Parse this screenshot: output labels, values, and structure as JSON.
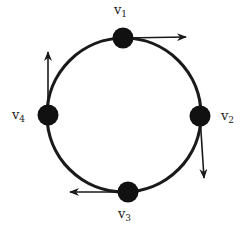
{
  "diagram": {
    "type": "ring-of-vertices-with-tangent-vectors",
    "colors": {
      "stroke": "#1a1a1a",
      "node": "#111111",
      "text": "#222222",
      "background": "#ffffff"
    },
    "circle": {
      "cx": 124,
      "cy": 115,
      "r": 77
    },
    "nodes": [
      {
        "id": "v1",
        "base": "v",
        "sub": "1",
        "x": 123,
        "y": 38,
        "label_pos": [
          114,
          14
        ],
        "arrow": {
          "x2": 186,
          "y2": 37,
          "dir": "right"
        }
      },
      {
        "id": "v2",
        "base": "v",
        "sub": "2",
        "x": 200,
        "y": 116,
        "label_pos": [
          221,
          120
        ],
        "arrow": {
          "x2": 204,
          "y2": 178,
          "dir": "down"
        }
      },
      {
        "id": "v3",
        "base": "v",
        "sub": "3",
        "x": 128,
        "y": 192,
        "label_pos": [
          118,
          218
        ],
        "arrow": {
          "x2": 70,
          "y2": 192,
          "dir": "left"
        }
      },
      {
        "id": "v4",
        "base": "v",
        "sub": "4",
        "x": 48,
        "y": 115,
        "label_pos": [
          12,
          119
        ],
        "arrow": {
          "x2": 48,
          "y2": 52,
          "dir": "up"
        }
      }
    ]
  }
}
